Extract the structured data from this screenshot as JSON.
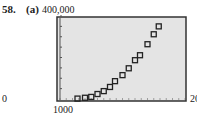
{
  "problem": {
    "number": "58.",
    "part": "(a)"
  },
  "chart_data": {
    "type": "scatter",
    "title": "",
    "xlabel": "",
    "ylabel": "",
    "xlim": [
      1000,
      2000
    ],
    "ylim": [
      0,
      400000
    ],
    "tick_labels": {
      "ymax": "400,000",
      "ymin": "0",
      "xmin": "1000",
      "xmax": "2000"
    },
    "grid": false,
    "marker": "square",
    "colors": {
      "frame": "#333333",
      "background": "#e4e4e4",
      "marker": "#222222"
    },
    "x": [
      1140,
      1200,
      1250,
      1300,
      1350,
      1400,
      1440,
      1500,
      1550,
      1600,
      1640,
      1700,
      1750,
      1790
    ],
    "y": [
      2000,
      6000,
      10000,
      24000,
      38000,
      58000,
      86000,
      115000,
      148000,
      187000,
      211000,
      264000,
      312000,
      350000
    ]
  }
}
